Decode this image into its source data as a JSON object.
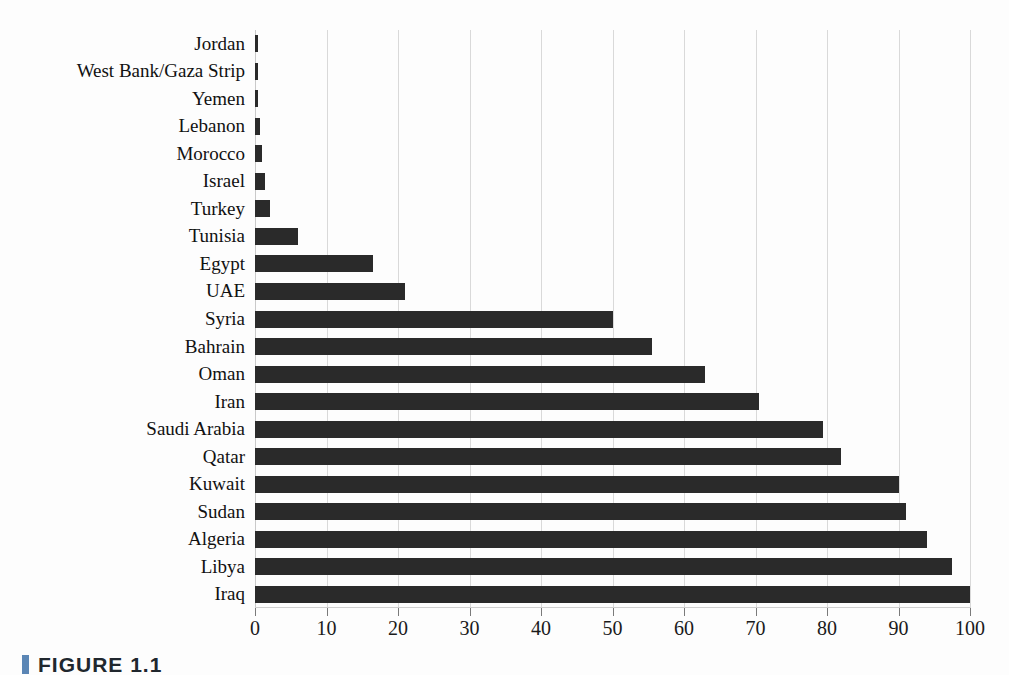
{
  "chart_data": {
    "type": "bar",
    "orientation": "horizontal",
    "title": "",
    "subtitle": "",
    "xlabel": "",
    "ylabel": "",
    "xlim": [
      0,
      100
    ],
    "xticks": [
      0,
      10,
      20,
      30,
      40,
      50,
      60,
      70,
      80,
      90,
      100
    ],
    "xtick_labels": [
      "0",
      "10",
      "20",
      "30",
      "40",
      "50",
      "60",
      "70",
      "80",
      "90",
      "100"
    ],
    "grid": true,
    "legend": false,
    "legend_position": "none",
    "bar_color": "#2a2a2a",
    "gridline_color": "#d9d9d9",
    "background_color": "#fdfdfd",
    "categories": [
      "Jordan",
      "West Bank/Gaza Strip",
      "Yemen",
      "Lebanon",
      "Morocco",
      "Israel",
      "Turkey",
      "Tunisia",
      "Egypt",
      "UAE",
      "Syria",
      "Bahrain",
      "Oman",
      "Iran",
      "Saudi Arabia",
      "Qatar",
      "Kuwait",
      "Sudan",
      "Algeria",
      "Libya",
      "Iraq"
    ],
    "values": [
      0.4,
      0.4,
      0.4,
      0.7,
      1.0,
      1.4,
      2.1,
      6.0,
      16.5,
      21.0,
      50.0,
      55.5,
      63.0,
      70.5,
      79.5,
      82.0,
      90.0,
      91.0,
      94.0,
      97.5,
      100.0
    ]
  },
  "caption": {
    "marker": "section-marker",
    "text": "FIGURE 1.1"
  }
}
